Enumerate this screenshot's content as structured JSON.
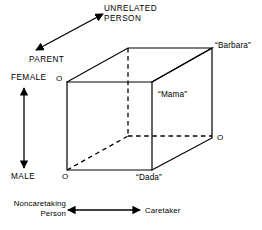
{
  "figure": {
    "type": "semantic-feature-cube",
    "width": 262,
    "height": 230,
    "stroke_color": "#000000",
    "background_color": "#ffffff"
  },
  "axes": {
    "diagonal": {
      "low_label": "PARENT",
      "high_label": "UNRELATED\nPERSON",
      "arrow": "double-headed"
    },
    "vertical": {
      "high_label": "FEMALE",
      "low_label": "MALE",
      "arrow": "double-headed"
    },
    "horizontal": {
      "left_label": "Noncaretaking\nPerson",
      "right_label": "Caretaker",
      "arrow": "double-headed"
    }
  },
  "cube": {
    "vertex_marks": {
      "top_left": "O",
      "bottom_left": "O",
      "right": "O"
    },
    "labels": {
      "barbara": "“Barbara”",
      "mama": "“Mama”",
      "dada": "“Dada”"
    }
  }
}
